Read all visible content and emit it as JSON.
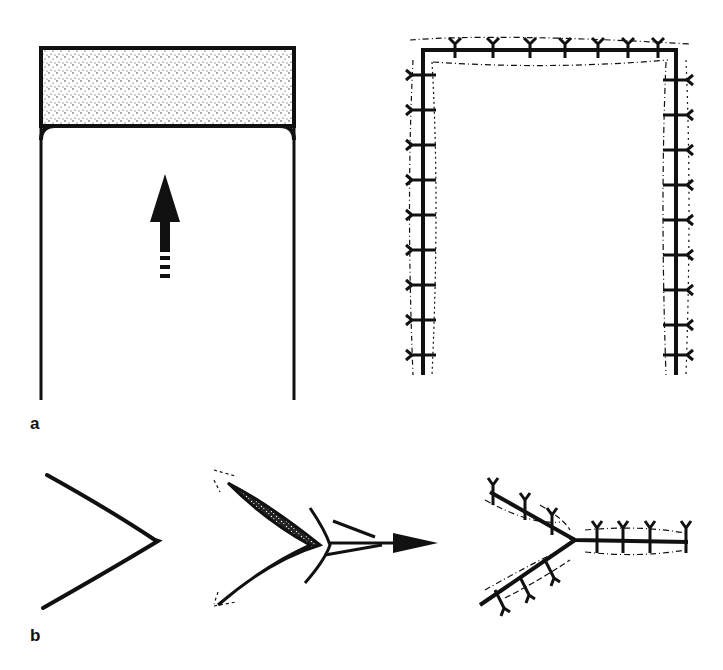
{
  "figure": {
    "panels": [
      {
        "label": "a",
        "components": [
          "tube-with-stippled-cap-and-upward-arrow",
          "sutured-U-shaped-incision"
        ]
      },
      {
        "label": "b",
        "components": [
          "V-shaped-incision",
          "V-flap-advancement-with-arrow",
          "sutured-Y-closure"
        ]
      }
    ],
    "colors": {
      "ink": "#111111",
      "background": "#ffffff"
    }
  }
}
